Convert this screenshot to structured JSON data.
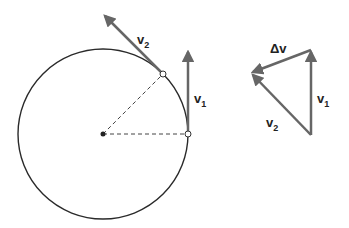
{
  "diagram": {
    "colors": {
      "circle": "#2a2a2a",
      "arrow": "#666666",
      "dashed": "#444444"
    },
    "circle": {
      "cx": 103,
      "cy": 134,
      "r": 85
    },
    "labels": {
      "v2_circle": {
        "main": "v",
        "sub": "2"
      },
      "v1_circle": {
        "main": "v",
        "sub": "1"
      },
      "delta_v": {
        "main": "Δv",
        "sub": ""
      },
      "v1_triangle": {
        "main": "v",
        "sub": "1"
      },
      "v2_triangle": {
        "main": "v",
        "sub": "2"
      }
    }
  }
}
